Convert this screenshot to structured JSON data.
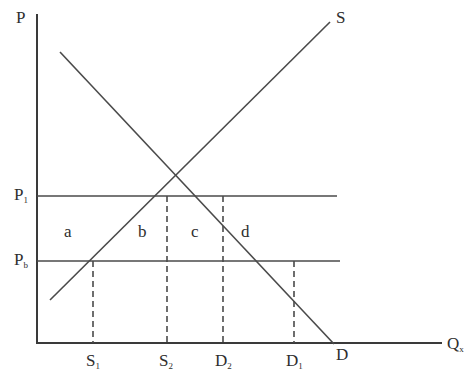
{
  "diagram": {
    "type": "supply-demand-price-support",
    "axes": {
      "y_label": "P",
      "x_label_main": "Q",
      "x_label_sub": "x"
    },
    "curves": {
      "supply_label": "S",
      "demand_label": "D"
    },
    "price_lines": [
      {
        "main": "P",
        "sub": "1"
      },
      {
        "main": "P",
        "sub": "b"
      }
    ],
    "quantity_marks": [
      {
        "main": "S",
        "sub": "1"
      },
      {
        "main": "S",
        "sub": "2"
      },
      {
        "main": "D",
        "sub": "2"
      },
      {
        "main": "D",
        "sub": "1"
      }
    ],
    "regions": [
      "a",
      "b",
      "c",
      "d"
    ]
  },
  "colors": {
    "line": "#4a4a4a",
    "text": "#2e2e2e",
    "background": "#ffffff"
  }
}
